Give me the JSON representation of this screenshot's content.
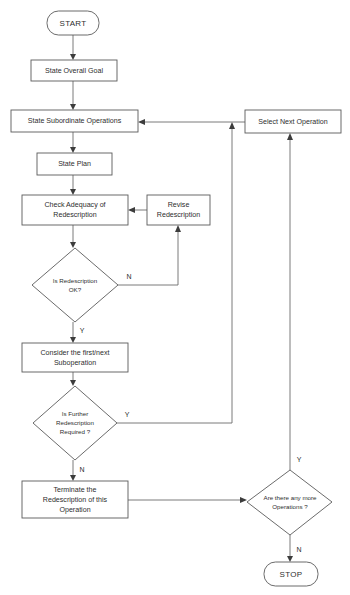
{
  "diagram": {
    "type": "flowchart",
    "title": "",
    "nodes": {
      "start": {
        "label": "START",
        "shape": "terminator"
      },
      "state_overall_goal": {
        "label": "State Overall Goal",
        "shape": "process"
      },
      "state_subordinate_operations": {
        "label": "State Subordinate Operations",
        "shape": "process"
      },
      "select_next_operation": {
        "label": "Select Next Operation",
        "shape": "process"
      },
      "state_plan": {
        "label": "State Plan",
        "shape": "process"
      },
      "check_adequacy": {
        "label_line1": "Check Adequacy of",
        "label_line2": "Redescription",
        "shape": "process"
      },
      "revise_redescription": {
        "label_line1": "Revise",
        "label_line2": "Redescription",
        "shape": "process"
      },
      "is_redescription_ok": {
        "label_line1": "Is Redescription",
        "label_line2": "OK?",
        "shape": "decision"
      },
      "consider_suboperation": {
        "label_line1": "Consider the first/next",
        "label_line2": "Suboperation",
        "shape": "process"
      },
      "is_further_redescription": {
        "label_line1": "Is Further",
        "label_line2": "Redescription",
        "label_line3": "Required ?",
        "shape": "decision"
      },
      "terminate_redescription": {
        "label_line1": "Terminate the",
        "label_line2": "Redescription of this",
        "label_line3": "Operation",
        "shape": "process"
      },
      "any_more_operations": {
        "label_line1": "Are there any more",
        "label_line2": "Operations ?",
        "shape": "decision"
      },
      "stop": {
        "label": "STOP",
        "shape": "terminator"
      }
    },
    "edge_labels": {
      "redescription_ok_no": "N",
      "redescription_ok_yes": "Y",
      "further_redescription_yes": "Y",
      "further_redescription_no": "N",
      "any_more_yes": "Y",
      "any_more_no": "N"
    },
    "colors": {
      "node_stroke": "#5a5a5a",
      "connector": "#6b6b6b",
      "text": "#2e2e2e",
      "background": "#ffffff"
    }
  }
}
